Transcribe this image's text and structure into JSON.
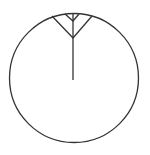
{
  "diagram": {
    "background": "#ffffff",
    "stroke_color": "#333333",
    "circle": {
      "cx": 74,
      "cy": 78,
      "r": 64.5
    },
    "spoke": {
      "x1": 73,
      "y1": 13.5,
      "x2": 73,
      "y2": 80
    },
    "outer_v": {
      "left": [
        52,
        16
      ],
      "apex": [
        73,
        38
      ],
      "right": [
        92,
        16
      ]
    },
    "inner_v": {
      "left": [
        65,
        14
      ],
      "apex": [
        73,
        21
      ],
      "right": [
        79,
        14
      ]
    }
  }
}
